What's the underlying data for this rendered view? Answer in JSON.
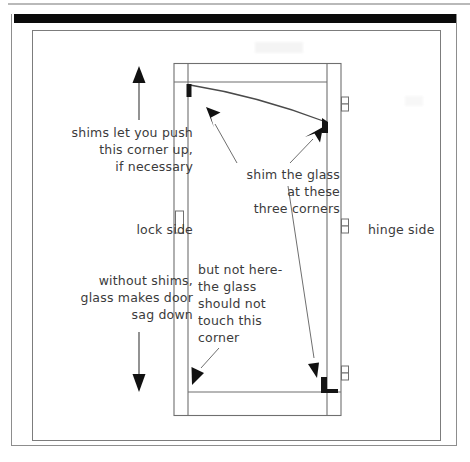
{
  "page": {
    "background_color": "#ffffff",
    "line_color": "#6f6f6f",
    "ink_color": "#3b3b3b",
    "shim_color": "#141414"
  },
  "annotations": {
    "shims_push": "shims let you push\nthis corner up,\nif necessary",
    "lock_side": "lock side",
    "without_shims": "without shims,\nglass makes door\nsag down",
    "shim_the_glass": "shim the glass\nat these\nthree corners",
    "but_not_here": "but not here-\nthe glass\nshould not\ntouch this\ncorner",
    "hinge_side": "hinge side"
  },
  "diagram": {
    "name": "door-elevation",
    "arrows": [
      {
        "name": "up-arrow",
        "direction": "up",
        "meaning": "shims push this corner up"
      },
      {
        "name": "down-arrow",
        "direction": "down",
        "meaning": "glass makes door sag down"
      },
      {
        "name": "pointer-top-left-shim",
        "target": "top-left-corner-shim"
      },
      {
        "name": "pointer-top-right-shim",
        "target": "top-right-corner-shim"
      },
      {
        "name": "pointer-bottom-right-shim",
        "target": "bottom-right-corner-shim"
      },
      {
        "name": "pointer-bottom-left-no-shim",
        "target": "bottom-left-corner-no-shim"
      }
    ],
    "shims": [
      {
        "name": "shim-top-left",
        "position": "top-left"
      },
      {
        "name": "shim-top-right",
        "position": "top-right"
      },
      {
        "name": "shim-bottom-right",
        "position": "bottom-right"
      }
    ],
    "hardware": {
      "hinges": 3,
      "hinge_side": "right",
      "strike_plate": 1,
      "lock_side": "left"
    },
    "glass_sag_line": "curved line from top-left down to top-right showing sagging glass"
  }
}
